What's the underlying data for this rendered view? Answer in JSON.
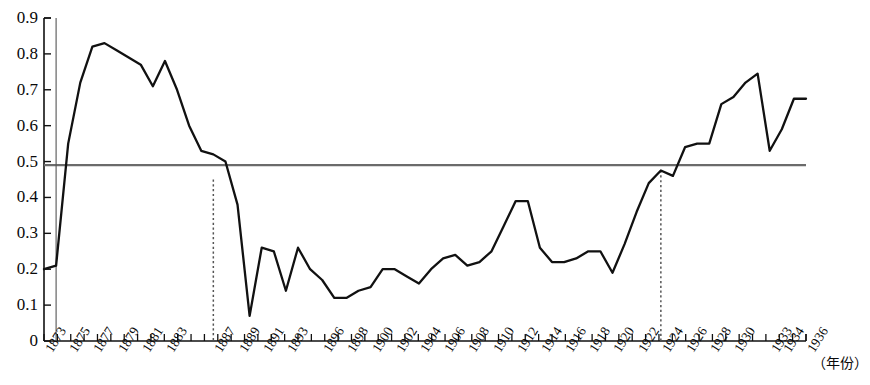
{
  "chart_data": {
    "type": "line",
    "title": "",
    "subtitle": "",
    "xlabel": "（年份）",
    "ylabel": "",
    "xlim": [
      1873,
      1936
    ],
    "ylim": [
      0,
      0.9
    ],
    "grid": false,
    "legend": null,
    "y_ticks": [
      "0.9",
      "0.8",
      "0.7",
      "0.6",
      "0.5",
      "0.4",
      "0.3",
      "0.2",
      "0.1",
      "0"
    ],
    "y_tick_values": [
      0.9,
      0.8,
      0.7,
      0.6,
      0.5,
      0.4,
      0.3,
      0.2,
      0.1,
      0
    ],
    "x_tick_labels": [
      "1873",
      "1875",
      "1877",
      "1879",
      "1881",
      "1883",
      "1887",
      "1889",
      "1891",
      "1893",
      "1896",
      "1898",
      "1900",
      "1902",
      "1904",
      "1906",
      "1908",
      "1910",
      "1912",
      "1914",
      "1916",
      "1918",
      "1920",
      "1922",
      "1924",
      "1926",
      "1928",
      "1930",
      "1933",
      "1934",
      "1936"
    ],
    "annotations": [
      {
        "name": "reference-line",
        "type": "hline",
        "value": 0.49,
        "color": "#6b6b6b",
        "label": ""
      },
      {
        "name": "marker-1887",
        "type": "vline-dotted",
        "x": 1887,
        "y": 0.45,
        "color": "#555555",
        "label": ""
      },
      {
        "name": "marker-1924",
        "type": "vline-dotted",
        "x": 1924,
        "y": 0.475,
        "color": "#555555",
        "label": ""
      },
      {
        "name": "marker-1874",
        "type": "vline-solid",
        "x": 1874,
        "y": 0.9,
        "color": "#555555",
        "label": ""
      }
    ],
    "series": [
      {
        "name": "series-1",
        "color": "#111111",
        "x": [
          1873,
          1874,
          1875,
          1876,
          1877,
          1878,
          1879,
          1880,
          1881,
          1882,
          1883,
          1884,
          1885,
          1886,
          1887,
          1888,
          1889,
          1890,
          1891,
          1892,
          1893,
          1894,
          1895,
          1896,
          1897,
          1898,
          1899,
          1900,
          1901,
          1902,
          1903,
          1904,
          1905,
          1906,
          1907,
          1908,
          1909,
          1910,
          1911,
          1912,
          1913,
          1914,
          1915,
          1916,
          1917,
          1918,
          1919,
          1920,
          1921,
          1922,
          1923,
          1924,
          1925,
          1926,
          1927,
          1928,
          1929,
          1930,
          1931,
          1932,
          1933,
          1934,
          1935,
          1936
        ],
        "values": [
          0.2,
          0.21,
          0.55,
          0.72,
          0.82,
          0.83,
          0.81,
          0.79,
          0.77,
          0.71,
          0.78,
          0.7,
          0.6,
          0.53,
          0.52,
          0.5,
          0.38,
          0.07,
          0.26,
          0.25,
          0.14,
          0.26,
          0.2,
          0.17,
          0.12,
          0.12,
          0.14,
          0.15,
          0.2,
          0.2,
          0.18,
          0.16,
          0.2,
          0.23,
          0.24,
          0.21,
          0.22,
          0.25,
          0.32,
          0.39,
          0.39,
          0.26,
          0.22,
          0.22,
          0.23,
          0.25,
          0.25,
          0.19,
          0.27,
          0.36,
          0.44,
          0.475,
          0.46,
          0.54,
          0.55,
          0.55,
          0.66,
          0.68,
          0.72,
          0.745,
          0.53,
          0.59,
          0.675,
          0.675
        ]
      }
    ]
  },
  "axis": {
    "y_axis_name": "y-axis",
    "x_axis_name": "x-axis"
  }
}
